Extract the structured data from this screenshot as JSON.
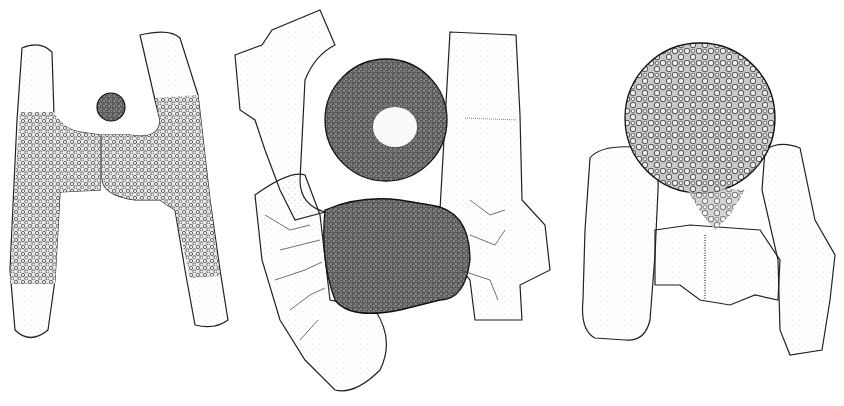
{
  "figure": {
    "background": "#ffffff",
    "ink_color": "#1a1a1a",
    "panels": [
      {
        "id": "panel-1",
        "subject": "H-shaped conjugating cell pair with small spherical zygote bud, granular contents"
      },
      {
        "id": "panel-2",
        "subject": "Dense granular zygospore with large sphere and fused lower mass between two cells, branching rhizoid-like lines"
      },
      {
        "id": "panel-3",
        "subject": "Large spherical zygospore with circular granules atop two empty cells"
      }
    ]
  }
}
